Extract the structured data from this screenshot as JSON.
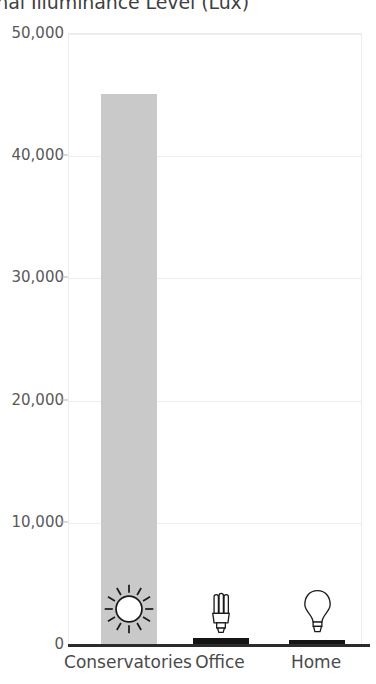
{
  "chart_data": {
    "type": "bar",
    "title_visible": "ternal Illuminance Level (Lux)",
    "xlabel": "",
    "ylabel": "",
    "categories": [
      "Conservatories",
      "Office",
      "Home"
    ],
    "values": [
      45000,
      500,
      300
    ],
    "series": [
      {
        "name": "Illuminance",
        "values": [
          45000,
          500,
          300
        ]
      }
    ],
    "ylim": [
      0,
      50000
    ],
    "y_ticks": [
      50000,
      40000,
      30000,
      20000,
      10000,
      0
    ],
    "y_tick_labels": [
      "50,000",
      "40,000",
      "30,000",
      "20,000",
      "10,000",
      "0"
    ],
    "grid": true,
    "legend": "none",
    "bar_colors": [
      "#c9c9c9",
      "#141414",
      "#141414"
    ],
    "icons": [
      "sun-icon",
      "cfl-bulb-icon",
      "incandescent-bulb-icon"
    ],
    "axis_color": "#2b2b2b",
    "gridline_color": "#ededed"
  }
}
